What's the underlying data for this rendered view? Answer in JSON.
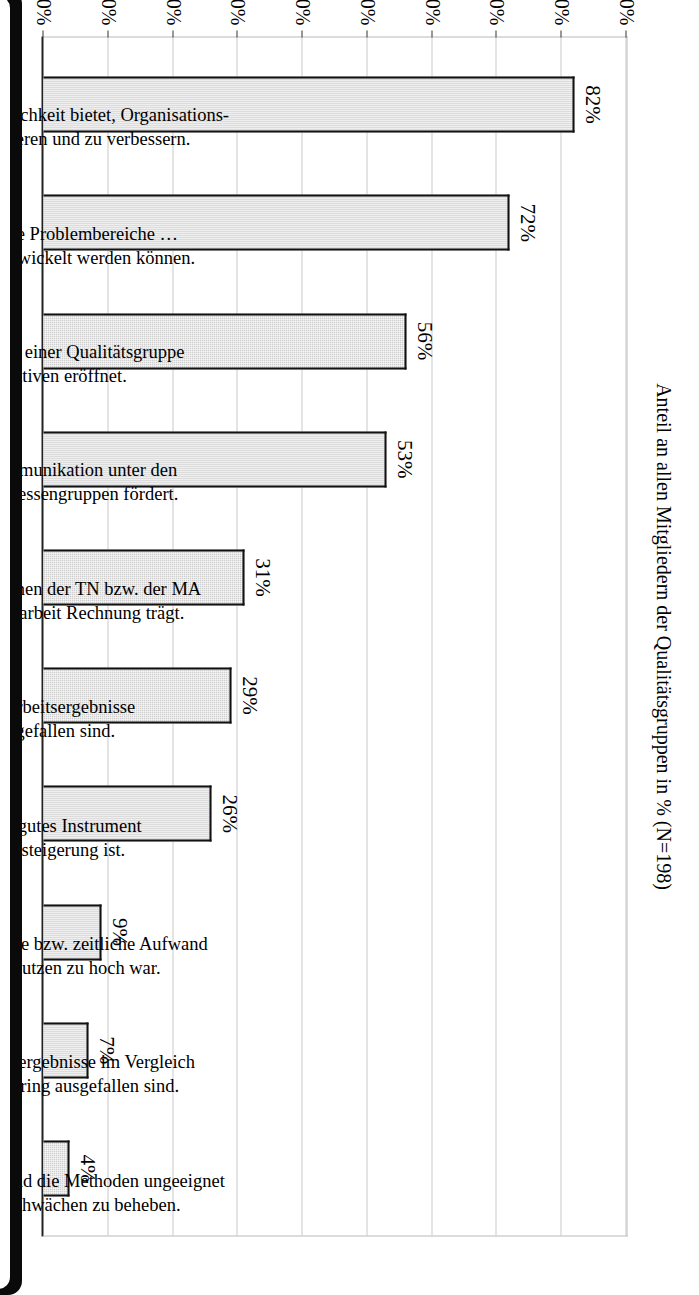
{
  "chart_data": {
    "type": "bar",
    "orientation": "vertical-rotated-page",
    "title": "",
    "xlabel": "",
    "ylabel": "Anteil an allen Mitgliedern der Qualitätsgruppen in % (N=198)",
    "ylim": [
      0,
      90
    ],
    "ytick_step": 10,
    "grid": true,
    "legend": false,
    "categories": [
      "Ja, weil es eine gute Möglichkeit bietet, Organisations-\nstrukturen zu reflektieren und zu verbessern.",
      "Ja, weil für konkrete Problembereiche …\nLösungsstrategien entwickelt werden können.",
      "Ja, weil die Arbeit in einer Qualitätsgruppe\nneue Perspektiven eröffnet.",
      "Ja, weil es die Kommunikation unter den\nverschiedenen Interessengruppen fördert.",
      "Ja, weil es … Ansprüchen der TN bzw. der MA\nund HK an Bildungsarbeit Rechnung trägt.",
      "Ja, weil die Arbeitsergebnisse\npositiv ausgefallen sind.",
      "Ja, weil es ein gutes Instrument\nzur Effizienzsteigerung ist.",
      "Nein, weil der personelle bzw. zeitliche Aufwand\ngegenüber dem Nutzen zu hoch war.",
      "Nein, weil die Arbeitsergebnisse im Vergleich\nzum Aufwand zu gering ausgefallen sind.",
      "Nein, weil das Material und die Methoden ungeeignet\nwaren, um die … Schwächen zu beheben."
    ],
    "values": [
      82,
      72,
      56,
      53,
      31,
      29,
      26,
      9,
      7,
      4
    ],
    "value_labels": [
      "82%",
      "72%",
      "56%",
      "53%",
      "31%",
      "29%",
      "26%",
      "9%",
      "7%",
      "4%"
    ],
    "ytick_labels": [
      "0%",
      "10%",
      "20%",
      "30%",
      "40%",
      "50%",
      "60%",
      "70%",
      "80%",
      "90%"
    ],
    "ytick_values": [
      0,
      10,
      20,
      30,
      40,
      50,
      60,
      70,
      80,
      90
    ],
    "colors": {
      "bar_fill": "#cfcfcf",
      "bar_border": "#111111",
      "grid": "#c9c9c9",
      "axis": "#222222",
      "text": "#000000",
      "background": "#ffffff",
      "page_edge": "#0a0a0a"
    }
  }
}
